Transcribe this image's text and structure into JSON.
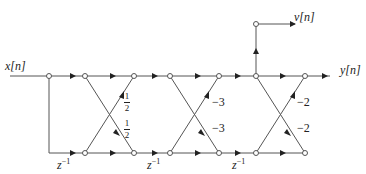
{
  "diagram": {
    "input_label": "x[n]",
    "output_y_label": "y[n]",
    "output_v_label": "v[n]",
    "delay_label_base": "z",
    "delay_label_exp": "−1",
    "stages": [
      {
        "upper_coeff_num": "1",
        "upper_coeff_den": "2",
        "lower_coeff_num": "1",
        "lower_coeff_den": "2"
      },
      {
        "upper_coeff": "−3",
        "lower_coeff": "−3"
      },
      {
        "upper_coeff": "−2",
        "lower_coeff": "−2"
      }
    ],
    "line_color": "#555555"
  }
}
